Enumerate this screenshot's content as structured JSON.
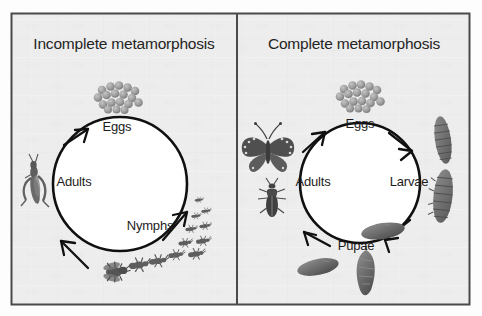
{
  "figure": {
    "background_color": "#fdfdfd",
    "panel_background_color": "#ededed",
    "border_color": "#4a4a4a",
    "ink_color": "#101010",
    "creature_fill": "#6e6e6e",
    "egg_fill": "#9a9a9a"
  },
  "panels": [
    {
      "id": "incomplete",
      "title": "Incomplete metamorphosis",
      "stages": [
        {
          "key": "eggs",
          "label": "Eggs"
        },
        {
          "key": "nymphs",
          "label": "Nymphs"
        },
        {
          "key": "adults",
          "label": "Adults"
        }
      ],
      "illustrations": [
        {
          "name": "egg-cluster-illustration",
          "stage": "eggs"
        },
        {
          "name": "nymph-series-illustration",
          "stage": "nymphs"
        },
        {
          "name": "adult-grasshopper-illustration",
          "stage": "adults"
        },
        {
          "name": "adult-fly-illustration",
          "stage": "adults"
        }
      ],
      "cycle_direction": "clockwise"
    },
    {
      "id": "complete",
      "title": "Complete metamorphosis",
      "stages": [
        {
          "key": "eggs",
          "label": "Eggs"
        },
        {
          "key": "larvae",
          "label": "Larvae"
        },
        {
          "key": "pupae",
          "label": "Pupae"
        },
        {
          "key": "adults",
          "label": "Adults"
        }
      ],
      "illustrations": [
        {
          "name": "egg-cluster-illustration",
          "stage": "eggs"
        },
        {
          "name": "larva-series-illustration",
          "stage": "larvae"
        },
        {
          "name": "pupa-series-illustration",
          "stage": "pupae"
        },
        {
          "name": "adult-butterfly-illustration",
          "stage": "adults"
        },
        {
          "name": "adult-beetle-illustration",
          "stage": "adults"
        }
      ],
      "cycle_direction": "clockwise"
    }
  ]
}
